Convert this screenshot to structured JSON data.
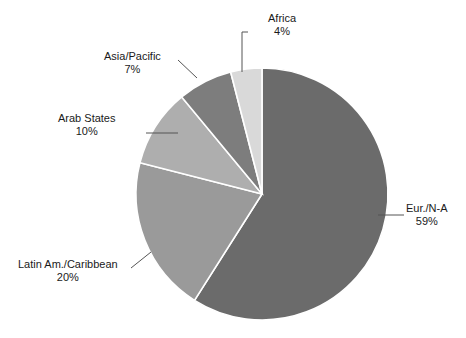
{
  "chart_data": {
    "type": "pie",
    "title": "",
    "subtitle": "",
    "xlabel": "",
    "ylabel": "",
    "legend_position": "none",
    "grid": false,
    "units": "percent",
    "start_angle_deg": 0,
    "direction": "clockwise",
    "categories": [
      "Eur./N-A",
      "Latin Am./Caribbean",
      "Arab States",
      "Asia/Pacific",
      "Africa"
    ],
    "values": [
      59,
      20,
      10,
      7,
      4
    ],
    "slices": [
      {
        "label": "Eur./N-A",
        "value": 59,
        "value_text": "59%",
        "color": "#6b6b6b",
        "start_deg": 0,
        "end_deg": 212.4
      },
      {
        "label": "Latin Am./Caribbean",
        "value": 20,
        "value_text": "20%",
        "color": "#9a9a9a",
        "start_deg": 212.4,
        "end_deg": 284.4
      },
      {
        "label": "Arab States",
        "value": 10,
        "value_text": "10%",
        "color": "#aeaeae",
        "start_deg": 284.4,
        "end_deg": 320.4
      },
      {
        "label": "Asia/Pacific",
        "value": 7,
        "value_text": "7%",
        "color": "#7d7d7d",
        "start_deg": 320.4,
        "end_deg": 345.6
      },
      {
        "label": "Africa",
        "value": 4,
        "value_text": "4%",
        "color": "#d9d9d9",
        "start_deg": 345.6,
        "end_deg": 360
      }
    ]
  },
  "colors": {
    "background": "#ffffff",
    "text": "#1a1a1a",
    "leader_line": "#555555",
    "slice_divider": "#ffffff"
  },
  "labels": {
    "africa": {
      "name": "Africa",
      "pct": "4%"
    },
    "asia_pacific": {
      "name": "Asia/Pacific",
      "pct": "7%"
    },
    "arab_states": {
      "name": "Arab States",
      "pct": "10%"
    },
    "latin_america": {
      "name": "Latin Am./Caribbean",
      "pct": "20%"
    },
    "eur_na": {
      "name": "Eur./N-A",
      "pct": "59%"
    }
  }
}
